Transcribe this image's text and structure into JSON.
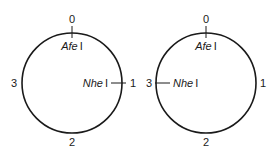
{
  "diagrams": [
    {
      "id": "left",
      "positions": [
        "0",
        "1",
        "2",
        "3"
      ],
      "sites": [
        {
          "name_italic": "Afe",
          "name_suffix": "I",
          "position": "0"
        },
        {
          "name_italic": "Nhe",
          "name_suffix": "I",
          "position": "1"
        }
      ]
    },
    {
      "id": "right",
      "positions": [
        "0",
        "1",
        "2",
        "3"
      ],
      "sites": [
        {
          "name_italic": "Afe",
          "name_suffix": "I",
          "position": "0"
        },
        {
          "name_italic": "Nhe",
          "name_suffix": "I",
          "position": "3"
        }
      ]
    }
  ],
  "colors": {
    "stroke": "#1a1a1a",
    "background": "#ffffff"
  }
}
